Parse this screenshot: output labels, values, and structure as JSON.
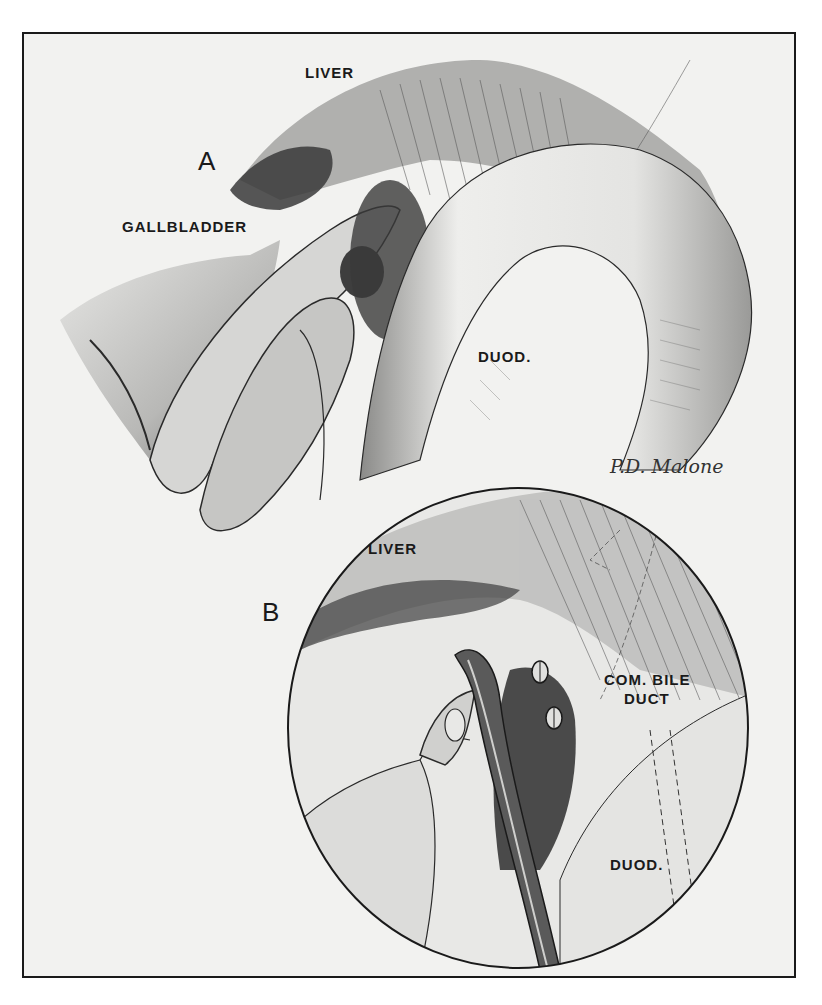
{
  "figure": {
    "panel_a": {
      "letter": "A",
      "labels": {
        "liver": "LIVER",
        "gallbladder": "GALLBLADDER",
        "duodenum": "DUOD."
      }
    },
    "panel_b": {
      "letter": "B",
      "labels": {
        "liver": "LIVER",
        "common_bile_duct_line1": "COM. BILE",
        "common_bile_duct_line2": "DUCT",
        "duodenum": "DUOD."
      }
    },
    "signature": "P.D. Malone",
    "colors": {
      "background": "#f2f2f0",
      "ink": "#1a1a1a",
      "shadow": "#4a4a4a",
      "midtone": "#9a9a9a",
      "light": "#dcdcda"
    }
  }
}
